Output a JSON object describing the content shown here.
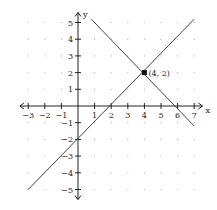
{
  "chart_data": {
    "type": "line",
    "title": "",
    "xlabel": "x",
    "ylabel": "y",
    "xlim": [
      -3,
      7
    ],
    "ylim": [
      -5,
      5
    ],
    "x_ticks": [
      -3,
      -2,
      -1,
      1,
      2,
      3,
      4,
      5,
      6,
      7
    ],
    "y_ticks": [
      -5,
      -4,
      -3,
      -2,
      -1,
      1,
      2,
      3,
      4,
      5
    ],
    "grid": "dots",
    "series": [
      {
        "name": "line-increasing",
        "equation": "y = x - 2",
        "points": [
          [
            -3,
            -5
          ],
          [
            7,
            5.2
          ]
        ]
      },
      {
        "name": "line-decreasing",
        "equation": "y = -x + 6",
        "points": [
          [
            0.8,
            5.2
          ],
          [
            7,
            -1.2
          ]
        ]
      }
    ],
    "annotations": [
      {
        "label": "(4, 2)",
        "x": 4,
        "y": 2,
        "marker": "square"
      }
    ],
    "colors": {
      "line": "#444444",
      "axis": "#222222",
      "grid_dot": "#aaaaaa"
    }
  }
}
